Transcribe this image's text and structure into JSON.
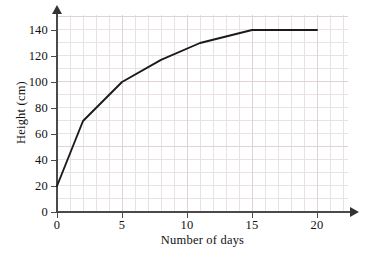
{
  "chart_data": {
    "type": "line",
    "title": "",
    "subtitle": "",
    "xlabel": "Number of days",
    "ylabel": "Height (cm)",
    "xlim": [
      0,
      20
    ],
    "ylim": [
      0,
      140
    ],
    "xticks": [
      0,
      5,
      10,
      15,
      20
    ],
    "yticks": [
      0,
      20,
      40,
      60,
      80,
      100,
      120,
      140
    ],
    "xtick_labels": [
      "0",
      "5",
      "10",
      "15",
      "20"
    ],
    "ytick_labels": [
      "0",
      "20",
      "40",
      "60",
      "80",
      "100",
      "120",
      "140"
    ],
    "grid": true,
    "grid_minor_step_x": 1,
    "grid_minor_step_y": 10,
    "legend": null,
    "annotations": [],
    "series": [
      {
        "name": "Height",
        "color": "#1a1a1a",
        "x": [
          0,
          2,
          5,
          8,
          11,
          15,
          20
        ],
        "y": [
          20,
          70,
          100,
          117,
          130,
          140,
          140
        ]
      }
    ]
  },
  "axis": {
    "y_title": "Height (cm)",
    "x_title": "Number of days",
    "y_ticks": [
      "140",
      "120",
      "100",
      "80",
      "60",
      "40",
      "20",
      "0"
    ],
    "x_ticks": [
      "0",
      "5",
      "10",
      "15",
      "20"
    ]
  },
  "colors": {
    "curve": "#1a1a1a",
    "axis": "#4a4a4a",
    "grid_minor": "#e9e2e4",
    "grid_major": "#ded4d7",
    "background": "#ffffff",
    "text": "#111111"
  }
}
